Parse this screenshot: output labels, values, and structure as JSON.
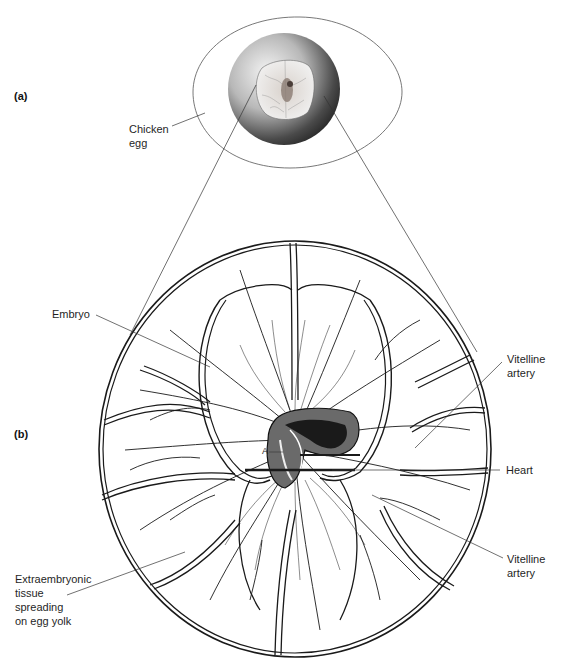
{
  "figure": {
    "panel_a": {
      "tag": "(a)",
      "labels": {
        "chicken_egg": "Chicken\negg"
      }
    },
    "panel_b": {
      "tag": "(b)",
      "labels": {
        "embryo": "Embryo",
        "vitelline_artery_upper": "Vitelline\nartery",
        "heart": "Heart",
        "vitelline_artery_lower": "Vitelline\nartery",
        "extraembryonic_tissue": "Extraembryonic\ntissue\nspreading\non egg yolk",
        "marker_a": "A"
      }
    },
    "colors": {
      "ink": "#1a1a1a",
      "leader_line": "#333333",
      "yolk_light": "#e8e8e8",
      "yolk_dark": "#2a2a2a",
      "background": "#ffffff"
    }
  }
}
